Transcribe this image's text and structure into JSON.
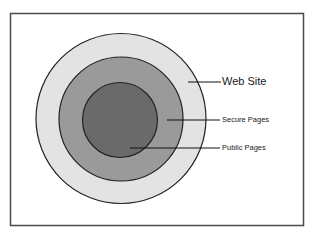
{
  "diagram": {
    "type": "nested-circles",
    "colors": {
      "frame": "#4a4a4a",
      "outline": "#222222",
      "web_site_fill": "#e3e3e3",
      "secure_pages_fill": "#9a9a9a",
      "public_pages_fill": "#6a6a6a",
      "background": "#ffffff"
    },
    "layers": [
      {
        "id": "web-site",
        "label": "Web Site"
      },
      {
        "id": "secure-pages",
        "label": "Secure Pages"
      },
      {
        "id": "public-pages",
        "label": "Public Pages"
      }
    ]
  }
}
